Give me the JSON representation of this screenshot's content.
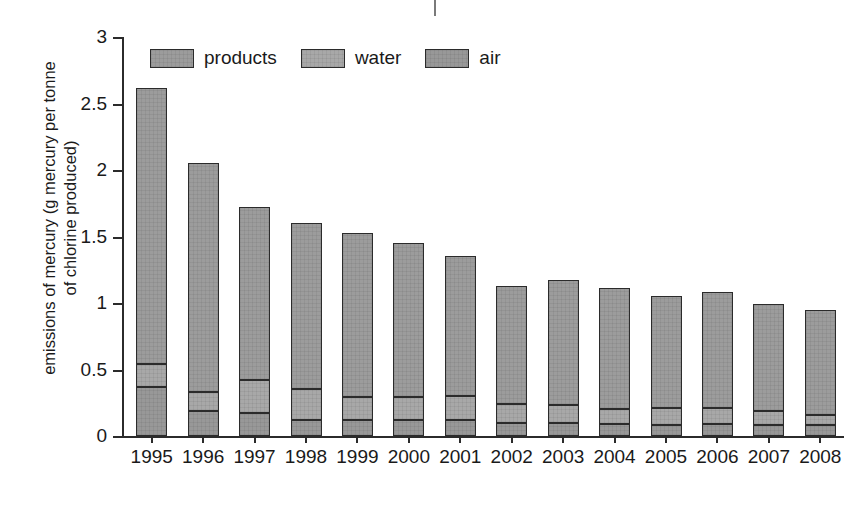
{
  "chart_data": {
    "type": "bar",
    "subtype": "stacked-bar",
    "title": "",
    "xlabel": "",
    "ylabel_lines": [
      "emissions of mercury (g mercury per tonne",
      "of chlorine produced)"
    ],
    "ylabel": "emissions of mercury (g mercury per tonne of chlorine produced)",
    "ylim": [
      0,
      3
    ],
    "ytick_labels": [
      "0",
      "0.5",
      "1",
      "1.5",
      "2",
      "2.5",
      "3"
    ],
    "ytick_values": [
      0,
      0.5,
      1,
      1.5,
      2,
      2.5,
      3
    ],
    "grid": false,
    "legend_position": "upper-left-inside",
    "categories": [
      "1995",
      "1996",
      "1997",
      "1998",
      "1999",
      "2000",
      "2001",
      "2002",
      "2003",
      "2004",
      "2005",
      "2006",
      "2007",
      "2008"
    ],
    "series": [
      {
        "name": "air",
        "stack_order": 1,
        "color": "#989898",
        "values": [
          0.37,
          0.19,
          0.17,
          0.12,
          0.12,
          0.12,
          0.12,
          0.1,
          0.1,
          0.09,
          0.08,
          0.09,
          0.08,
          0.08
        ]
      },
      {
        "name": "water",
        "stack_order": 2,
        "color": "#a8a8a8",
        "values": [
          0.17,
          0.14,
          0.25,
          0.23,
          0.17,
          0.17,
          0.18,
          0.14,
          0.13,
          0.11,
          0.13,
          0.12,
          0.11,
          0.08
        ]
      },
      {
        "name": "products",
        "stack_order": 3,
        "color": "#9c9c9c",
        "values": [
          2.08,
          1.72,
          1.3,
          1.25,
          1.24,
          1.16,
          1.05,
          0.89,
          0.94,
          0.91,
          0.84,
          0.87,
          0.8,
          0.79
        ]
      }
    ],
    "totals": [
      2.62,
      2.05,
      1.72,
      1.6,
      1.53,
      1.45,
      1.35,
      1.13,
      1.17,
      1.11,
      1.05,
      1.08,
      0.99,
      0.95
    ]
  },
  "legend": {
    "items": [
      {
        "label": "products",
        "swatch": "products-swatch"
      },
      {
        "label": "water",
        "swatch": "water-swatch"
      },
      {
        "label": "air",
        "swatch": "air-swatch"
      }
    ]
  }
}
